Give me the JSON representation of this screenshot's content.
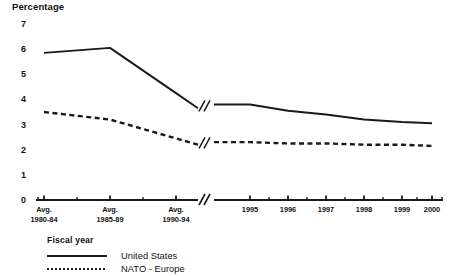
{
  "chart_data": {
    "type": "line",
    "title": "Percentage",
    "ylabel": "Percentage",
    "xlabel": "Fiscal year",
    "ylim": [
      0,
      7
    ],
    "yticks": [
      0,
      1,
      2,
      3,
      4,
      5,
      6,
      7
    ],
    "ytick_labels": [
      "0",
      "1",
      "2",
      "3",
      "4",
      "5",
      "6",
      "7"
    ],
    "grid": false,
    "axis_break": true,
    "legend_position": "below-left",
    "categories": [
      "Avg. 1980-84",
      "Avg. 1985-89",
      "Avg. 1990-94",
      "1995",
      "1996",
      "1997",
      "1998",
      "1999",
      "2000"
    ],
    "xtick_labels": [
      {
        "line1": "Avg.",
        "line2": "1980-84"
      },
      {
        "line1": "Avg.",
        "line2": "1985-89"
      },
      {
        "line1": "Avg.",
        "line2": "1990-94"
      },
      {
        "line1": "1995",
        "line2": ""
      },
      {
        "line1": "1996",
        "line2": ""
      },
      {
        "line1": "1997",
        "line2": ""
      },
      {
        "line1": "1998",
        "line2": ""
      },
      {
        "line1": "1999",
        "line2": ""
      },
      {
        "line1": "2000",
        "line2": ""
      }
    ],
    "series": [
      {
        "name": "United States",
        "style": "solid",
        "color": "#1a1a1a",
        "values": [
          5.85,
          6.05,
          4.25,
          3.8,
          3.55,
          3.4,
          3.2,
          3.1,
          3.05
        ]
      },
      {
        "name": "NATO - Europe",
        "style": "dotted",
        "color": "#1a1a1a",
        "values": [
          3.5,
          3.2,
          2.45,
          2.3,
          2.25,
          2.25,
          2.2,
          2.2,
          2.15
        ]
      }
    ]
  },
  "legend": {
    "items": [
      {
        "label": "United States",
        "style": "solid"
      },
      {
        "label": "NATO - Europe",
        "style": "dotted"
      }
    ]
  },
  "axes": {
    "y_title": "Percentage",
    "x_title": "Fiscal year"
  }
}
